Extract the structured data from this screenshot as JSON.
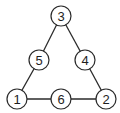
{
  "diagram": {
    "type": "graph",
    "shape": "triangle",
    "nodes": [
      {
        "id": "n1",
        "label": "1",
        "x": 17,
        "y": 99
      },
      {
        "id": "n2",
        "label": "2",
        "x": 106,
        "y": 99
      },
      {
        "id": "n3",
        "label": "3",
        "x": 61,
        "y": 16
      },
      {
        "id": "n4",
        "label": "4",
        "x": 85,
        "y": 60
      },
      {
        "id": "n5",
        "label": "5",
        "x": 39,
        "y": 60
      },
      {
        "id": "n6",
        "label": "6",
        "x": 61,
        "y": 99
      }
    ],
    "edges": [
      {
        "from": "3",
        "to": "5"
      },
      {
        "from": "5",
        "to": "1"
      },
      {
        "from": "3",
        "to": "4"
      },
      {
        "from": "4",
        "to": "2"
      },
      {
        "from": "1",
        "to": "6"
      },
      {
        "from": "6",
        "to": "2"
      }
    ],
    "colors": {
      "stroke": "#2a2a2a",
      "fill": "#ffffff",
      "text": "#1e1e1e"
    }
  }
}
